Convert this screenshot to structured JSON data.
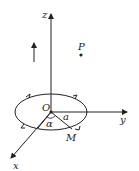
{
  "diagram": {
    "labels": {
      "z_axis": "z",
      "y_axis": "y",
      "x_axis": "x",
      "origin": "O",
      "point_p": "P",
      "point_m": "M",
      "radius": "a",
      "angle": "α"
    },
    "colors": {
      "stroke": "#222222",
      "background": "#ffffff"
    }
  }
}
